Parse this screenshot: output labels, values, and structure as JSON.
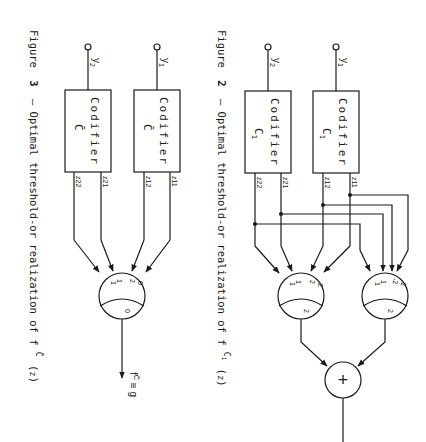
{
  "figure2": {
    "caption_prefix": "Figure",
    "caption_number": "2",
    "caption_text": "– Optimal threshold-or realization of f",
    "caption_sup": "C",
    "caption_sup_sub": "1",
    "caption_arg": "z",
    "inputs": [
      {
        "label": "y",
        "sub": "1"
      },
      {
        "label": "y",
        "sub": "2"
      }
    ],
    "codifiers": [
      {
        "title": "Codifier",
        "code": "C",
        "code_sub": "1",
        "outputs": [
          "z11",
          "z12"
        ]
      },
      {
        "title": "Codifier",
        "code": "C",
        "code_sub": "1",
        "outputs": [
          "z21",
          "z22"
        ]
      }
    ],
    "gate_right": {
      "weights": [
        "-2",
        "-2",
        "1",
        "1"
      ],
      "threshold": "2"
    },
    "gate_left": {
      "weights": [
        "2",
        "2",
        "1",
        "1"
      ],
      "threshold": "2"
    },
    "or_symbol": "+"
  },
  "figure3": {
    "caption_prefix": "Figure",
    "caption_number": "3",
    "caption_text": "– Optimal threshold-or realization of f",
    "caption_sup": "C̄",
    "caption_arg": "z",
    "inputs": [
      {
        "label": "y",
        "sub": "1"
      },
      {
        "label": "y",
        "sub": "2"
      }
    ],
    "codifiers": [
      {
        "title": "Codifier",
        "code": "C̄",
        "outputs": [
          "z11",
          "z12"
        ]
      },
      {
        "title": "Codifier",
        "code": "C̄",
        "outputs": [
          "z21",
          "z22"
        ]
      }
    ],
    "gate": {
      "weights": [
        "0",
        "2",
        "1",
        "1"
      ],
      "threshold": "0"
    },
    "output_label": "f",
    "output_sup": "C̄",
    "output_eq": "≡ g"
  }
}
